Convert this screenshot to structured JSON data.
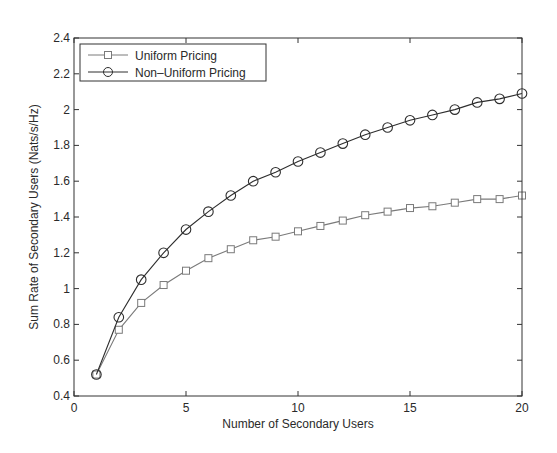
{
  "chart_data": {
    "type": "line",
    "title": "",
    "xlabel": "Number of Secondary Users",
    "ylabel": "Sum Rate of Secondary Users (Nats/s/Hz)",
    "xlim": [
      0,
      20
    ],
    "ylim": [
      0.4,
      2.4
    ],
    "xticks": [
      0,
      5,
      10,
      15,
      20
    ],
    "xtick_labels": [
      "0",
      "5",
      "10",
      "15",
      "20"
    ],
    "yticks": [
      0.4,
      0.6,
      0.8,
      1.0,
      1.2,
      1.4,
      1.6,
      1.8,
      2.0,
      2.2,
      2.4
    ],
    "ytick_labels": [
      "0.4",
      "0.6",
      "0.8",
      "1",
      "1.2",
      "1.4",
      "1.6",
      "1.8",
      "2",
      "2.2",
      "2.4"
    ],
    "grid": false,
    "legend_position": "upper left",
    "x": [
      1,
      2,
      3,
      4,
      5,
      6,
      7,
      8,
      9,
      10,
      11,
      12,
      13,
      14,
      15,
      16,
      17,
      18,
      19,
      20
    ],
    "series": [
      {
        "name": "Uniform Pricing",
        "marker": "square",
        "color": "#7a7a7a",
        "values": [
          0.52,
          0.77,
          0.92,
          1.02,
          1.1,
          1.17,
          1.22,
          1.27,
          1.29,
          1.32,
          1.35,
          1.38,
          1.41,
          1.43,
          1.45,
          1.46,
          1.48,
          1.5,
          1.5,
          1.52
        ]
      },
      {
        "name": "Non-Uniform Pricing",
        "marker": "circle",
        "color": "#2e2e2e",
        "values": [
          0.52,
          0.84,
          1.05,
          1.2,
          1.33,
          1.43,
          1.52,
          1.6,
          1.65,
          1.71,
          1.76,
          1.81,
          1.86,
          1.9,
          1.94,
          1.97,
          2.0,
          2.04,
          2.06,
          2.09
        ]
      }
    ]
  },
  "legend": {
    "items": [
      {
        "label": "Uniform Pricing"
      },
      {
        "label": "Non–Uniform Pricing"
      }
    ]
  }
}
